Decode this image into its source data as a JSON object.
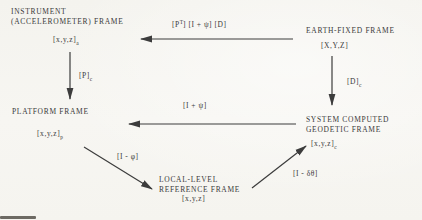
{
  "figure": {
    "paper_color": "#f6f5f1",
    "ink_color": "#3a3a3a"
  },
  "nodes": {
    "instrument": {
      "line1": "INSTRUMENT",
      "line2": "(ACCELEROMETER) FRAME",
      "coords": "[x,y,z]",
      "coords_sub": "a"
    },
    "earth": {
      "line1": "EARTH-FIXED FRAME",
      "coords": "[X,Y,Z]"
    },
    "platform": {
      "line1": "PLATFORM FRAME",
      "coords": "[x,y,z]",
      "coords_sub": "p"
    },
    "computed": {
      "line1": "SYSTEM COMPUTED",
      "line2": "GEODETIC FRAME",
      "coords": "[x,y,z]",
      "coords_sub": "c"
    },
    "local_level": {
      "line1": "LOCAL-LEVEL",
      "line2": "REFERENCE FRAME",
      "coords": "[x,y,z]"
    }
  },
  "edges": {
    "earth_to_instrument": {
      "pre": "[P",
      "sup": "T",
      "post": "] [I + ψ] [D]"
    },
    "instrument_to_platform": {
      "main": "[P]",
      "sub": "c"
    },
    "earth_to_computed": {
      "main": "[D]",
      "sub": "c"
    },
    "computed_to_platform": {
      "main": "[I + ψ]"
    },
    "platform_to_local": {
      "main": "[I - φ]"
    },
    "local_to_computed": {
      "main": "[I - δθ]"
    }
  }
}
